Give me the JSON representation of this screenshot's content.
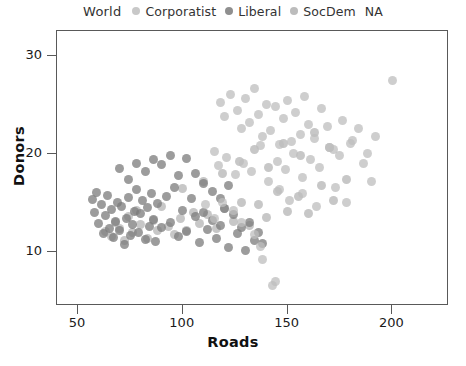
{
  "legend": {
    "title": "World",
    "items": [
      {
        "label": "Corporatist",
        "color": "#c8c8c8"
      },
      {
        "label": "Liberal",
        "color": "#8f8f8f"
      },
      {
        "label": "SocDem",
        "color": "#bcbcbc"
      },
      {
        "label": "NA",
        "color": "#ffffff"
      }
    ]
  },
  "chart_data": {
    "type": "scatter",
    "title": "",
    "xlabel": "Roads",
    "ylabel": "Donors",
    "xlim": [
      40,
      227
    ],
    "ylim": [
      4.5,
      32.5
    ],
    "xticks": [
      50,
      100,
      150,
      200
    ],
    "yticks": [
      10,
      20,
      30
    ],
    "grid": false,
    "legend_position": "top-center",
    "marker_size_px": 9,
    "marker_opacity": 0.75,
    "series": [
      {
        "name": "Corporatist",
        "color": "#b4b4b4",
        "points": [
          [
            63,
            12.1
          ],
          [
            66,
            11.6
          ],
          [
            68,
            13.0
          ],
          [
            70,
            12.4
          ],
          [
            72,
            11.2
          ],
          [
            74,
            13.6
          ],
          [
            76,
            12.0
          ],
          [
            78,
            14.2
          ],
          [
            80,
            12.8
          ],
          [
            83,
            11.4
          ],
          [
            86,
            13.2
          ],
          [
            88,
            12.2
          ],
          [
            90,
            14.6
          ],
          [
            93,
            12.6
          ],
          [
            96,
            11.8
          ],
          [
            99,
            13.4
          ],
          [
            102,
            12.2
          ],
          [
            105,
            14.0
          ],
          [
            108,
            12.9
          ],
          [
            112,
            13.8
          ],
          [
            116,
            12.4
          ],
          [
            120,
            14.4
          ],
          [
            124,
            13.1
          ],
          [
            128,
            15.0
          ],
          [
            132,
            12.7
          ],
          [
            136,
            14.8
          ],
          [
            140,
            13.5
          ],
          [
            145,
            16.2
          ],
          [
            150,
            14.1
          ],
          [
            155,
            15.6
          ],
          [
            160,
            13.9
          ],
          [
            166,
            16.8
          ],
          [
            172,
            15.2
          ],
          [
            178,
            17.4
          ],
          [
            100,
            16.5
          ],
          [
            110,
            17.2
          ],
          [
            119,
            18.0
          ],
          [
            127,
            19.2
          ],
          [
            134,
            20.4
          ],
          [
            141,
            18.6
          ],
          [
            148,
            21.0
          ],
          [
            156,
            19.8
          ],
          [
            163,
            22.2
          ],
          [
            170,
            20.6
          ]
        ]
      },
      {
        "name": "Liberal",
        "color": "#7b7b7b",
        "points": [
          [
            57,
            15.3
          ],
          [
            58,
            14.0
          ],
          [
            59,
            16.1
          ],
          [
            60,
            12.9
          ],
          [
            61,
            14.8
          ],
          [
            62,
            11.9
          ],
          [
            63,
            13.7
          ],
          [
            64,
            15.8
          ],
          [
            65,
            12.4
          ],
          [
            66,
            14.3
          ],
          [
            67,
            11.5
          ],
          [
            68,
            13.1
          ],
          [
            69,
            15.0
          ],
          [
            70,
            12.2
          ],
          [
            71,
            14.6
          ],
          [
            72,
            10.8
          ],
          [
            73,
            13.4
          ],
          [
            74,
            15.5
          ],
          [
            75,
            11.7
          ],
          [
            76,
            12.8
          ],
          [
            77,
            14.1
          ],
          [
            78,
            16.4
          ],
          [
            79,
            12.0
          ],
          [
            80,
            13.9
          ],
          [
            81,
            15.2
          ],
          [
            82,
            11.3
          ],
          [
            83,
            14.5
          ],
          [
            84,
            12.6
          ],
          [
            85,
            16.0
          ],
          [
            86,
            13.3
          ],
          [
            87,
            11.1
          ],
          [
            88,
            14.9
          ],
          [
            90,
            12.5
          ],
          [
            92,
            15.7
          ],
          [
            94,
            13.0
          ],
          [
            96,
            16.6
          ],
          [
            98,
            11.6
          ],
          [
            100,
            14.2
          ],
          [
            102,
            12.1
          ],
          [
            104,
            15.4
          ],
          [
            106,
            13.6
          ],
          [
            108,
            11.0
          ],
          [
            110,
            14.0
          ],
          [
            112,
            12.3
          ],
          [
            114,
            13.2
          ],
          [
            116,
            11.4
          ],
          [
            118,
            12.7
          ],
          [
            120,
            14.4
          ],
          [
            122,
            10.5
          ],
          [
            124,
            13.8
          ],
          [
            126,
            11.9
          ],
          [
            128,
            12.5
          ],
          [
            130,
            10.2
          ],
          [
            132,
            13.0
          ],
          [
            134,
            11.2
          ],
          [
            136,
            12.0
          ],
          [
            138,
            10.9
          ],
          [
            86,
            19.4
          ],
          [
            90,
            18.9
          ],
          [
            94,
            19.8
          ],
          [
            98,
            17.8
          ],
          [
            82,
            18.2
          ],
          [
            78,
            19.0
          ],
          [
            74,
            17.4
          ],
          [
            70,
            18.5
          ],
          [
            102,
            19.5
          ],
          [
            106,
            18.0
          ],
          [
            110,
            17.0
          ],
          [
            114,
            16.2
          ],
          [
            118,
            15.4
          ],
          [
            122,
            16.8
          ]
        ]
      },
      {
        "name": "SocDem",
        "color": "#bdbdbd",
        "points": [
          [
            118,
            25.2
          ],
          [
            120,
            23.8
          ],
          [
            123,
            26.0
          ],
          [
            126,
            24.4
          ],
          [
            128,
            22.6
          ],
          [
            130,
            25.6
          ],
          [
            132,
            23.2
          ],
          [
            134,
            26.6
          ],
          [
            136,
            24.0
          ],
          [
            138,
            21.8
          ],
          [
            140,
            25.0
          ],
          [
            142,
            22.4
          ],
          [
            144,
            24.8
          ],
          [
            146,
            20.9
          ],
          [
            148,
            23.6
          ],
          [
            150,
            25.4
          ],
          [
            152,
            21.2
          ],
          [
            154,
            24.2
          ],
          [
            156,
            22.0
          ],
          [
            158,
            25.8
          ],
          [
            160,
            23.0
          ],
          [
            163,
            21.6
          ],
          [
            166,
            24.6
          ],
          [
            169,
            22.8
          ],
          [
            172,
            20.4
          ],
          [
            176,
            23.4
          ],
          [
            180,
            21.0
          ],
          [
            184,
            22.6
          ],
          [
            188,
            20.0
          ],
          [
            192,
            21.8
          ],
          [
            115,
            20.2
          ],
          [
            117,
            18.8
          ],
          [
            121,
            19.6
          ],
          [
            125,
            17.9
          ],
          [
            129,
            19.0
          ],
          [
            133,
            18.2
          ],
          [
            137,
            20.8
          ],
          [
            141,
            17.2
          ],
          [
            145,
            19.2
          ],
          [
            149,
            18.4
          ],
          [
            153,
            20.0
          ],
          [
            157,
            17.6
          ],
          [
            161,
            19.4
          ],
          [
            165,
            18.6
          ],
          [
            170,
            20.6
          ],
          [
            175,
            19.8
          ],
          [
            181,
            21.4
          ],
          [
            186,
            19.0
          ],
          [
            200,
            27.5
          ],
          [
            143,
            6.6
          ],
          [
            144,
            7.0
          ],
          [
            138,
            9.2
          ],
          [
            137,
            10.6
          ],
          [
            134,
            11.8
          ],
          [
            128,
            13.0
          ],
          [
            124,
            14.2
          ],
          [
            119,
            15.0
          ],
          [
            115,
            13.4
          ],
          [
            111,
            14.8
          ],
          [
            146,
            16.4
          ],
          [
            151,
            15.2
          ],
          [
            157,
            16.0
          ],
          [
            164,
            14.6
          ],
          [
            173,
            16.6
          ],
          [
            178,
            15.0
          ],
          [
            190,
            17.2
          ]
        ]
      }
    ]
  }
}
